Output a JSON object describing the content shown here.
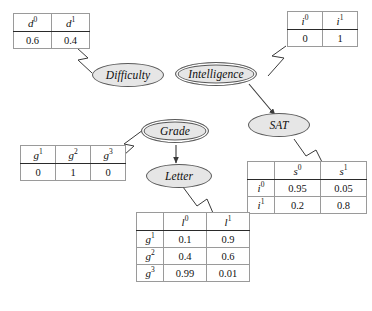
{
  "diagram": {
    "background_color": "#ffffff",
    "node_fill": "#e6e6e6",
    "node_stroke": "#5a5a5a",
    "edge_color": "#3a3a3a"
  },
  "nodes": {
    "difficulty": {
      "label": "Difficulty",
      "observed": false
    },
    "intelligence": {
      "label": "Intelligence",
      "observed": true
    },
    "grade": {
      "label": "Grade",
      "observed": true
    },
    "sat": {
      "label": "SAT",
      "observed": false
    },
    "letter": {
      "label": "Letter",
      "observed": false
    }
  },
  "edges": [
    {
      "from": "intelligence",
      "to": "sat"
    },
    {
      "from": "grade",
      "to": "letter"
    }
  ],
  "tables": {
    "difficulty": {
      "headers": [
        "d",
        "d"
      ],
      "header_sups": [
        "0",
        "1"
      ],
      "values": [
        "0.6",
        "0.4"
      ]
    },
    "intelligence": {
      "headers": [
        "i",
        "i"
      ],
      "header_sups": [
        "0",
        "1"
      ],
      "values": [
        "0",
        "1"
      ]
    },
    "grade": {
      "headers": [
        "g",
        "g",
        "g"
      ],
      "header_sups": [
        "1",
        "2",
        "3"
      ],
      "values": [
        "0",
        "1",
        "0"
      ]
    },
    "sat": {
      "corner": "",
      "headers": [
        "s",
        "s"
      ],
      "header_sups": [
        "0",
        "1"
      ],
      "rows": [
        {
          "label": "i",
          "label_sup": "0",
          "values": [
            "0.95",
            "0.05"
          ]
        },
        {
          "label": "i",
          "label_sup": "1",
          "values": [
            "0.2",
            "0.8"
          ]
        }
      ]
    },
    "letter": {
      "corner": "",
      "headers": [
        "l",
        "l"
      ],
      "header_sups": [
        "0",
        "1"
      ],
      "rows": [
        {
          "label": "g",
          "label_sup": "1",
          "values": [
            "0.1",
            "0.9"
          ]
        },
        {
          "label": "g",
          "label_sup": "2",
          "values": [
            "0.4",
            "0.6"
          ]
        },
        {
          "label": "g",
          "label_sup": "3",
          "values": [
            "0.99",
            "0.01"
          ]
        }
      ]
    }
  }
}
